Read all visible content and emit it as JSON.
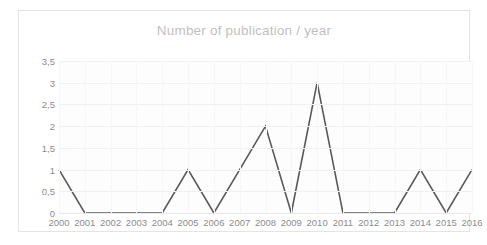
{
  "chart_data": {
    "type": "line",
    "title": "Number of publication / year",
    "xlabel": "",
    "ylabel": "",
    "categories": [
      "2000",
      "2001",
      "2002",
      "2003",
      "2004",
      "2005",
      "2006",
      "2007",
      "2008",
      "2009",
      "2010",
      "2011",
      "2012",
      "2013",
      "2014",
      "2015",
      "2016"
    ],
    "values": [
      1,
      0,
      0,
      0,
      0,
      1,
      0,
      1,
      2,
      0,
      3,
      0,
      0,
      0,
      1,
      0,
      1
    ],
    "series": [
      {
        "name": "Number of publication",
        "values": [
          1,
          0,
          0,
          0,
          0,
          1,
          0,
          1,
          2,
          0,
          3,
          0,
          0,
          0,
          1,
          0,
          1
        ]
      }
    ],
    "ylim": [
      0,
      3.5
    ],
    "ytick_values": [
      0,
      0.5,
      1,
      1.5,
      2,
      2.5,
      3,
      3.5
    ],
    "ytick_labels": [
      "0",
      "0,5",
      "1",
      "1,5",
      "2",
      "2,5",
      "3",
      "3,5"
    ],
    "grid": true,
    "legend": false,
    "legend_position": "none",
    "markers": false,
    "colors": {
      "line": "#595959",
      "title_text": "#bfbfbf",
      "tick_text": "#8c8c8c",
      "gridline": "#f0f0f0",
      "plot_background": "#fdfdfd",
      "chart_border": "#e4e4e4",
      "page_background": "#ffffff"
    }
  }
}
